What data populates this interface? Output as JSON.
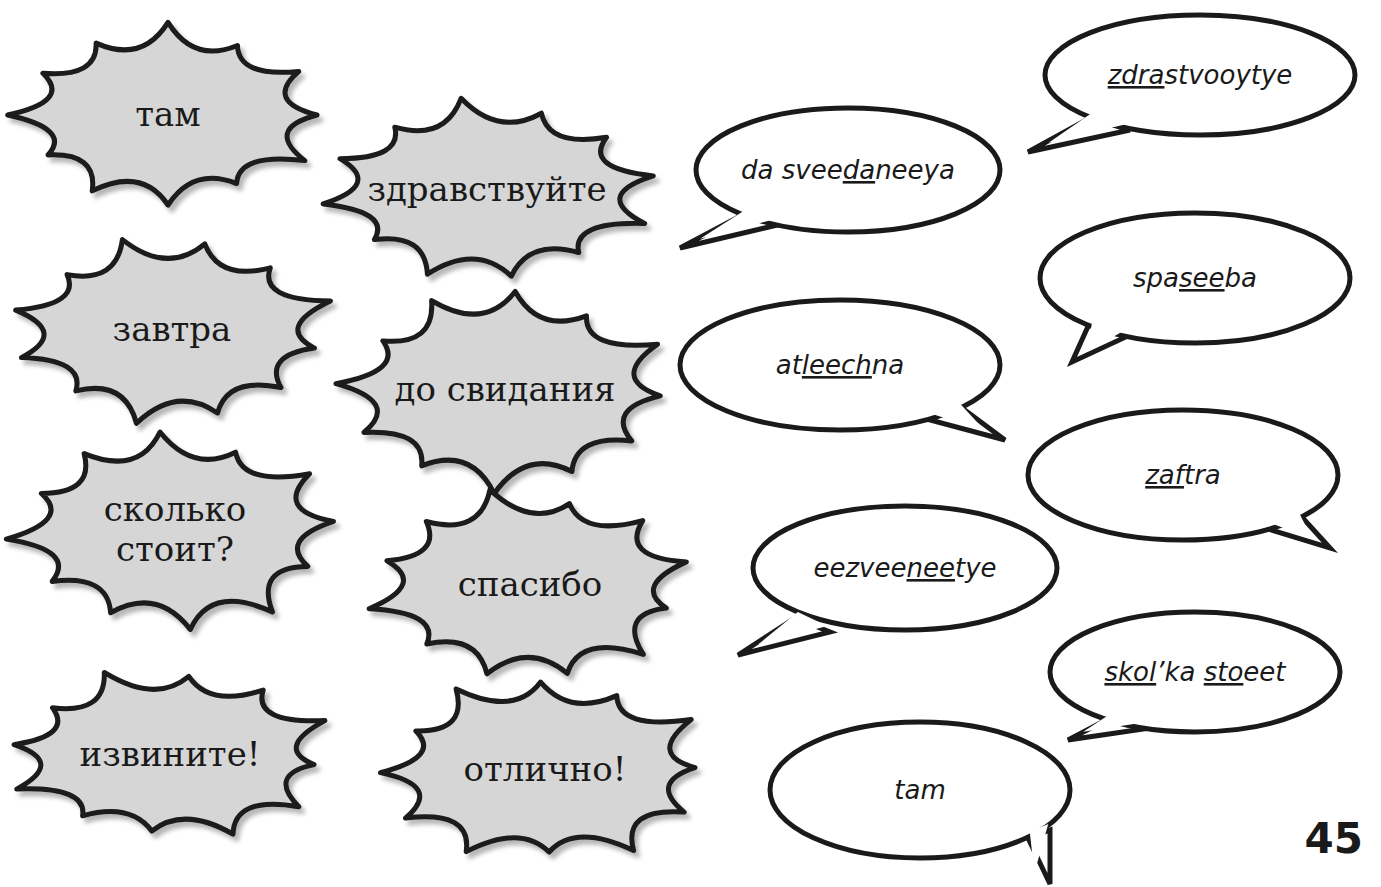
{
  "page": {
    "page_number": "45",
    "colors": {
      "burst_fill": "#d6d6d6",
      "burst_stroke": "#1a1a1a",
      "bubble_fill": "#ffffff",
      "bubble_stroke": "#1a1a1a",
      "text": "#1a1a1a"
    }
  },
  "russian_words": [
    {
      "id": "tam",
      "lines": [
        "там"
      ],
      "cx": 168,
      "cy": 115,
      "rx": 150,
      "ry": 85
    },
    {
      "id": "zdravstvuyte",
      "lines": [
        "здравствуйте"
      ],
      "cx": 487,
      "cy": 190,
      "rx": 158,
      "ry": 85
    },
    {
      "id": "zavtra",
      "lines": [
        "завтра"
      ],
      "cx": 172,
      "cy": 330,
      "rx": 155,
      "ry": 88
    },
    {
      "id": "do-svidaniya",
      "lines": [
        "до свидания"
      ],
      "cx": 505,
      "cy": 390,
      "rx": 160,
      "ry": 95
    },
    {
      "id": "skolko-stoit",
      "lines": [
        "сколько",
        "стоит?"
      ],
      "cx": 175,
      "cy": 530,
      "rx": 158,
      "ry": 92
    },
    {
      "id": "spasibo",
      "lines": [
        "спасибо"
      ],
      "cx": 530,
      "cy": 585,
      "rx": 155,
      "ry": 90
    },
    {
      "id": "izvinite",
      "lines": [
        "извините!"
      ],
      "cx": 170,
      "cy": 755,
      "rx": 158,
      "ry": 82
    },
    {
      "id": "otlichno",
      "lines": [
        "отлично!"
      ],
      "cx": 545,
      "cy": 770,
      "rx": 160,
      "ry": 88
    }
  ],
  "transliterations": [
    {
      "id": "zdrastvooytye",
      "segments": [
        {
          "t": "zdra",
          "u": true
        },
        {
          "t": "stvooytye",
          "u": false
        }
      ],
      "cx": 1200,
      "cy": 75,
      "rx": 155,
      "ry": 60,
      "tail": [
        [
          1090,
          118
        ],
        [
          1028,
          152
        ],
        [
          1130,
          130
        ]
      ]
    },
    {
      "id": "da-sveedaneeya",
      "segments": [
        {
          "t": "da svee",
          "u": false
        },
        {
          "t": "da",
          "u": true
        },
        {
          "t": "neeya",
          "u": false
        }
      ],
      "cx": 848,
      "cy": 170,
      "rx": 152,
      "ry": 62,
      "tail": [
        [
          748,
          212
        ],
        [
          680,
          248
        ],
        [
          790,
          222
        ]
      ]
    },
    {
      "id": "spaseeba",
      "segments": [
        {
          "t": "spa",
          "u": false
        },
        {
          "t": "see",
          "u": true
        },
        {
          "t": "ba",
          "u": false
        }
      ],
      "cx": 1195,
      "cy": 278,
      "rx": 155,
      "ry": 65,
      "tail": [
        [
          1090,
          322
        ],
        [
          1072,
          362
        ],
        [
          1130,
          335
        ]
      ]
    },
    {
      "id": "atleechna",
      "segments": [
        {
          "t": "at",
          "u": false
        },
        {
          "t": "leech",
          "u": true
        },
        {
          "t": "na",
          "u": false
        }
      ],
      "cx": 840,
      "cy": 365,
      "rx": 160,
      "ry": 65,
      "tail": [
        [
          958,
          405
        ],
        [
          1005,
          440
        ],
        [
          930,
          420
        ]
      ]
    },
    {
      "id": "zaftra",
      "segments": [
        {
          "t": "zaf",
          "u": true
        },
        {
          "t": "tra",
          "u": false
        }
      ],
      "cx": 1183,
      "cy": 475,
      "rx": 155,
      "ry": 65,
      "tail": [
        [
          1300,
          515
        ],
        [
          1330,
          548
        ],
        [
          1265,
          528
        ]
      ]
    },
    {
      "id": "eezveeneetye",
      "segments": [
        {
          "t": "eezvee",
          "u": false
        },
        {
          "t": "nee",
          "u": true
        },
        {
          "t": "tye",
          "u": false
        }
      ],
      "cx": 905,
      "cy": 568,
      "rx": 152,
      "ry": 62,
      "tail": [
        [
          795,
          618
        ],
        [
          738,
          655
        ],
        [
          830,
          632
        ]
      ]
    },
    {
      "id": "skolka-stoeet",
      "segments": [
        {
          "t": "skol",
          "u": true
        },
        {
          "t": "’ka ",
          "u": false
        },
        {
          "t": "sto",
          "u": true
        },
        {
          "t": "eet",
          "u": false
        }
      ],
      "cx": 1195,
      "cy": 672,
      "rx": 145,
      "ry": 60,
      "tail": [
        [
          1110,
          718
        ],
        [
          1068,
          740
        ],
        [
          1150,
          728
        ]
      ]
    },
    {
      "id": "tam",
      "segments": [
        {
          "t": "tam",
          "u": false
        }
      ],
      "cx": 920,
      "cy": 790,
      "rx": 150,
      "ry": 68,
      "tail": [
        [
          1028,
          838
        ],
        [
          1050,
          884
        ],
        [
          1050,
          830
        ]
      ]
    }
  ]
}
